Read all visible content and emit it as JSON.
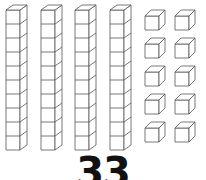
{
  "diagram": {
    "type": "base-ten-blocks",
    "tens_rods": 4,
    "cubes_per_rod": 10,
    "unit_cubes": 10,
    "unit_columns": 2,
    "unit_rows": 5,
    "stroke_color": "#555555",
    "fill_color": "#ffffff"
  },
  "number_label": "33"
}
